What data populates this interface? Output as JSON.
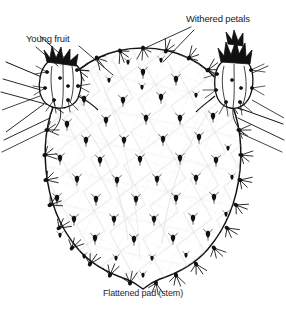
{
  "figure": {
    "type": "botanical-line-illustration",
    "background_color": "#ffffff",
    "ink_color": "#111111",
    "labels": {
      "young_fruit": "Young fruit",
      "withered_petals": "Withered petals"
    },
    "caption": "Flattened pad (stem)",
    "parts": [
      {
        "name": "flattened-pad",
        "label": "Flattened pad (stem)"
      },
      {
        "name": "young-fruit-left",
        "label": "Young fruit"
      },
      {
        "name": "young-fruit-right",
        "label": "Withered petals"
      }
    ],
    "leader_lines": [
      {
        "from": "Young fruit",
        "to": "pad-upper-left-areole"
      },
      {
        "from": "Young fruit",
        "to": "young-fruit-left"
      },
      {
        "from": "Withered petals",
        "to": "pad-top-areole"
      },
      {
        "from": "Withered petals",
        "to": "young-fruit-right"
      }
    ]
  }
}
